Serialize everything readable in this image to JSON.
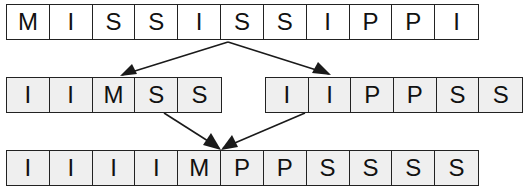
{
  "diagram": {
    "type": "merge-sort-split-merge",
    "colors": {
      "border": "#222222",
      "top_row_fill": "#ffffff",
      "lower_rows_fill": "#efefef",
      "arrow": "#1a1a1a"
    },
    "top_row": {
      "cells": [
        "M",
        "I",
        "S",
        "S",
        "I",
        "S",
        "S",
        "I",
        "P",
        "P",
        "I"
      ]
    },
    "middle_left": {
      "cells": [
        "I",
        "I",
        "M",
        "S",
        "S"
      ]
    },
    "middle_right": {
      "cells": [
        "I",
        "I",
        "P",
        "P",
        "S",
        "S"
      ]
    },
    "bottom_row": {
      "cells": [
        "I",
        "I",
        "I",
        "I",
        "M",
        "P",
        "P",
        "S",
        "S",
        "S",
        "S"
      ]
    },
    "arrows": [
      {
        "from": "top_row",
        "to": "middle_left"
      },
      {
        "from": "top_row",
        "to": "middle_right"
      },
      {
        "from": "middle_left",
        "to": "bottom_row"
      },
      {
        "from": "middle_right",
        "to": "bottom_row"
      }
    ]
  }
}
